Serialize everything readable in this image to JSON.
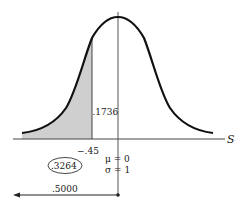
{
  "diagram": {
    "type": "normal-distribution",
    "axis_label": "S",
    "mean_label": "μ = 0",
    "sd_label": "σ = 1",
    "cutoff_label": "−.45",
    "cutoff_value": -0.45,
    "table_area_label": ".1736",
    "shaded_area_label": ".3264",
    "half_area_label": ".5000",
    "colors": {
      "curve": "#111111",
      "shade": "#cfcfcf",
      "axis": "#333333",
      "mean_line": "#555555"
    }
  }
}
